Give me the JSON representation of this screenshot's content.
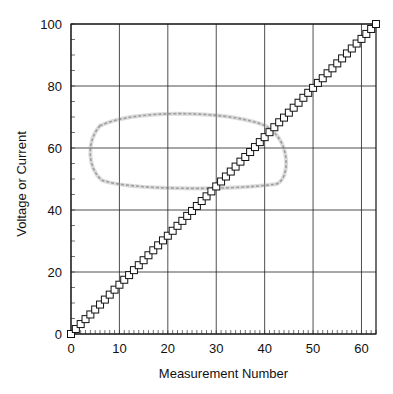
{
  "chart_data": {
    "type": "scatter",
    "title": "",
    "xlabel": "Measurement Number",
    "ylabel": "Voltage or Current",
    "xlim": [
      0,
      63
    ],
    "ylim": [
      0,
      100
    ],
    "x_ticks": [
      0,
      10,
      20,
      30,
      40,
      50,
      60
    ],
    "y_ticks": [
      0,
      20,
      40,
      60,
      80,
      100
    ],
    "x_tick_labels": [
      "0",
      "10",
      "20",
      "30",
      "40",
      "50",
      "60"
    ],
    "y_tick_labels": [
      "0",
      "20",
      "40",
      "60",
      "80",
      "100"
    ],
    "x_minor_step": 1,
    "y_minor_step": 5,
    "grid": true,
    "legend": null,
    "marker": "open-square",
    "series": [
      {
        "name": "measurements",
        "x": [
          0,
          1,
          2,
          3,
          4,
          5,
          6,
          7,
          8,
          9,
          10,
          11,
          12,
          13,
          14,
          15,
          16,
          17,
          18,
          19,
          20,
          21,
          22,
          23,
          24,
          25,
          26,
          27,
          28,
          29,
          30,
          31,
          32,
          33,
          34,
          35,
          36,
          37,
          38,
          39,
          40,
          41,
          42,
          43,
          44,
          45,
          46,
          47,
          48,
          49,
          50,
          51,
          52,
          53,
          54,
          55,
          56,
          57,
          58,
          59,
          60,
          61,
          62,
          63
        ],
        "y": [
          0,
          1.6,
          3.2,
          4.8,
          6.3,
          7.9,
          9.5,
          11.1,
          12.7,
          14.3,
          15.9,
          17.5,
          19.0,
          20.6,
          22.2,
          23.8,
          25.4,
          27.0,
          28.6,
          30.2,
          31.7,
          33.3,
          34.9,
          36.5,
          38.1,
          39.7,
          41.3,
          42.9,
          44.4,
          46.0,
          47.6,
          49.2,
          50.8,
          52.4,
          54.0,
          55.6,
          57.1,
          58.7,
          60.3,
          61.9,
          63.5,
          65.1,
          66.7,
          68.3,
          69.8,
          71.4,
          73.0,
          74.6,
          76.2,
          77.8,
          79.4,
          81.0,
          82.5,
          84.1,
          85.7,
          87.3,
          88.9,
          90.5,
          92.1,
          93.7,
          95.2,
          96.8,
          98.4,
          100
        ]
      }
    ],
    "annotations": [
      {
        "type": "smudge-loop",
        "description": "faint gray hand-drawn-looking closed loop artifact",
        "x_range": [
          4.3,
          45
        ],
        "y_range": [
          47,
          71
        ]
      }
    ]
  },
  "axes": {
    "x_title": "Measurement Number",
    "y_title": "Voltage or Current"
  }
}
